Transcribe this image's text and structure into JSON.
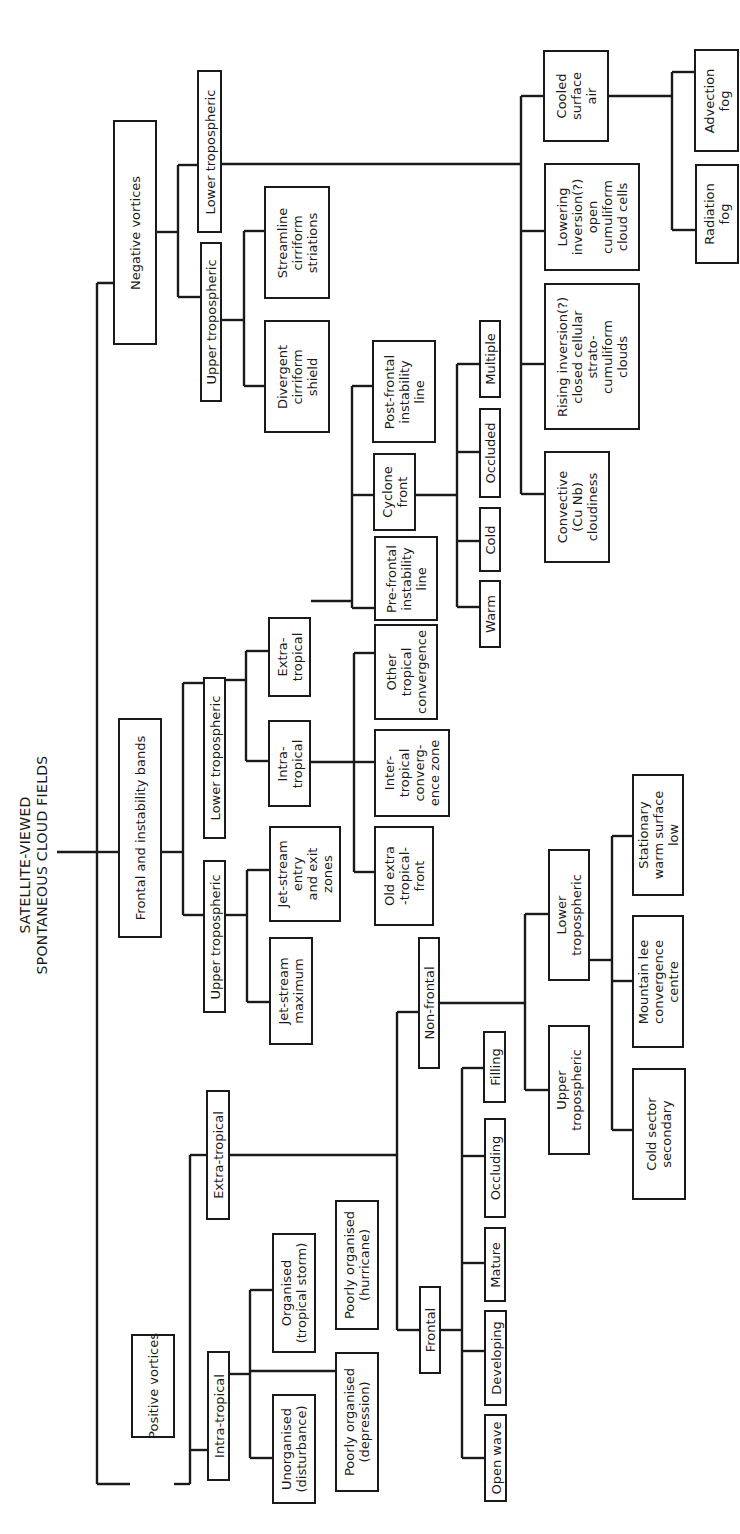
{
  "title": {
    "line1": "SATELLITE-VIEWED",
    "line2": "SPONTANEOUS CLOUD FIELDS",
    "text": "SATELLITE-VIEWED\nSPONTANEOUS CLOUD FIELDS"
  },
  "nodes": {
    "positive_vortices": "Positive vortices",
    "frontal_instability_bands": "Frontal and instability bands",
    "negative_vortices": "Negative vortices",
    "pv_intra_tropical": "Intra-tropical",
    "pv_extra_tropical": "Extra-tropical",
    "unorganised": "Unorganised\n(disturbance)",
    "poorly_organised_depression": "Poorly organised\n(depression)",
    "organised_tropical_storm": "Organised\n(tropical storm)",
    "poorly_organised_hurricane": "Poorly organised\n(hurricane)",
    "frontal": "Frontal",
    "non_frontal": "Non-frontal",
    "open_wave": "Open wave",
    "developing": "Developing",
    "mature": "Mature",
    "occluding": "Occluding",
    "filling": "Filling",
    "nf_upper_tropospheric": "Upper\ntropospheric",
    "nf_lower_tropospheric": "Lower\ntropospheric",
    "cold_sector_secondary": "Cold sector\nsecondary",
    "mountain_lee": "Mountain lee\nconvergence\ncentre",
    "stationary_warm_low": "Stationary\nwarm surface\nlow",
    "fb_upper_tropospheric": "Upper tropospheric",
    "fb_lower_tropospheric": "Lower tropospheric",
    "jet_stream_maximum": "Jet-stream\nmaximum",
    "jet_stream_entry_exit": "Jet-stream\nentry\nand exit\nzones",
    "fb_intra_tropical": "Intra-\ntropical",
    "fb_extra_tropical": "Extra-\ntropical",
    "old_extra_tropical_front": "Old extra\n-tropical-\nfront",
    "itcz": "Inter-\ntropical\nconverg-\nence zone",
    "other_tropical_convergence": "Other\ntropical\nconvergence",
    "pre_frontal_instability": "Pre-frontal\ninstability\nline",
    "cyclone_front": "Cyclone\nfront",
    "post_frontal_instability": "Post-frontal\ninstability\nline",
    "warm": "Warm",
    "cold": "Cold",
    "occluded": "Occluded",
    "multiple": "Multiple",
    "nv_upper_tropospheric": "Upper tropospheric",
    "nv_lower_tropospheric": "Lower tropospheric",
    "divergent_cirriform_shield": "Divergent\ncirriform\nshield",
    "streamline_cirriform": "Streamline\ncirriform\nstriations",
    "convective_cu_nb": "Convective\n(Cu Nb)\ncloudiness",
    "rising_inversion": "Rising inversion(?)\nclosed cellular\nstrato-\ncumuliform\nclouds",
    "lowering_inversion": "Lowering\ninversion(?)\nopen\ncumuliform\ncloud cells",
    "cooled_surface_air": "Cooled\nsurface\nair",
    "radiation_fog": "Radiation\nfog",
    "advection_fog": "Advection\nfog"
  }
}
